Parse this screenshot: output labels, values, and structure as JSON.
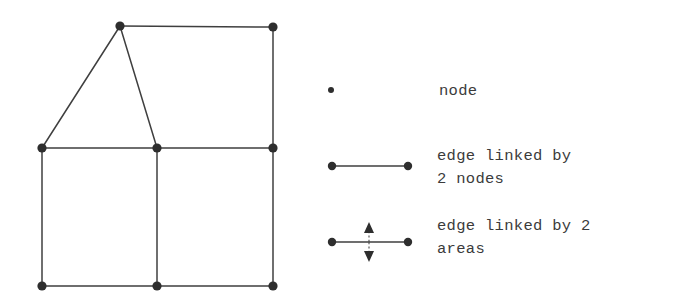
{
  "figure": {
    "stroke_color": "#3f3f3f",
    "node_color": "#2e2e2e",
    "background": "#ffffff",
    "graph": {
      "nodes": [
        {
          "id": "apex",
          "name": "node-apex",
          "x": 120,
          "y": 26,
          "r": 4.6
        },
        {
          "id": "top-right",
          "name": "node-top-right",
          "x": 273,
          "y": 27,
          "r": 4.6
        },
        {
          "id": "mid-left",
          "name": "node-mid-left",
          "x": 42,
          "y": 148,
          "r": 4.6
        },
        {
          "id": "mid-center",
          "name": "node-mid-center",
          "x": 157,
          "y": 148,
          "r": 4.6
        },
        {
          "id": "mid-right",
          "name": "node-mid-right",
          "x": 273,
          "y": 148,
          "r": 4.6
        },
        {
          "id": "bottom-left",
          "name": "node-bottom-left",
          "x": 42,
          "y": 286,
          "r": 4.6
        },
        {
          "id": "bottom-center",
          "name": "node-bottom-center",
          "x": 157,
          "y": 286,
          "r": 4.6
        },
        {
          "id": "bottom-right",
          "name": "node-bottom-right",
          "x": 273,
          "y": 286,
          "r": 4.6
        }
      ],
      "edges": [
        {
          "name": "edge-apex-topright",
          "from": "apex",
          "to": "top-right"
        },
        {
          "name": "edge-topright-midright",
          "from": "top-right",
          "to": "mid-right"
        },
        {
          "name": "edge-apex-midleft",
          "from": "apex",
          "to": "mid-left"
        },
        {
          "name": "edge-apex-midcenter",
          "from": "apex",
          "to": "mid-center"
        },
        {
          "name": "edge-midleft-midcenter",
          "from": "mid-left",
          "to": "mid-center"
        },
        {
          "name": "edge-midcenter-midright",
          "from": "mid-center",
          "to": "mid-right"
        },
        {
          "name": "edge-midleft-bottomleft",
          "from": "mid-left",
          "to": "bottom-left"
        },
        {
          "name": "edge-midcenter-bottomcenter",
          "from": "mid-center",
          "to": "bottom-center"
        },
        {
          "name": "edge-midright-bottomright",
          "from": "mid-right",
          "to": "bottom-right"
        },
        {
          "name": "edge-bottomleft-bottomcenter",
          "from": "bottom-left",
          "to": "bottom-center"
        },
        {
          "name": "edge-bottomcenter-bottomright",
          "from": "bottom-center",
          "to": "bottom-right"
        }
      ]
    }
  },
  "legend": {
    "items": [
      {
        "key": "node",
        "symbol": "single-dot",
        "label": "node",
        "label_lines": [
          "node"
        ]
      },
      {
        "key": "edge-2-nodes",
        "symbol": "line-with-two-endpoint-dots",
        "label": "edge linked by 2 nodes",
        "label_lines": [
          "edge linked by",
          "2 nodes"
        ]
      },
      {
        "key": "edge-2-areas",
        "symbol": "line-with-two-endpoint-dots-and-vertical-dashed-double-arrow",
        "label": "edge linked by 2 areas",
        "label_lines": [
          "edge linked by 2",
          "areas"
        ]
      }
    ],
    "symbols": {
      "node_dot": {
        "x": 331,
        "y": 90,
        "r": 3.0
      },
      "edge_line": {
        "x1": 332,
        "x2": 408,
        "y": 166,
        "dot_r": 4.2
      },
      "area_edge": {
        "x1": 332,
        "x2": 408,
        "y": 242,
        "dot_r": 4.2,
        "arrow_x": 369,
        "arrow_top_y": 222,
        "arrow_bottom_y": 262
      }
    }
  }
}
